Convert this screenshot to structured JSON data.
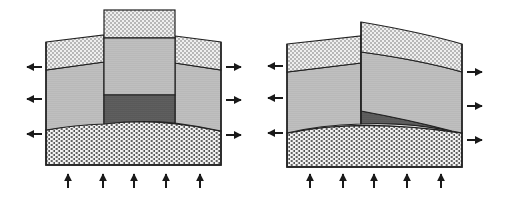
{
  "figure": {
    "panels": [
      {
        "id": "left",
        "label": "Horst-style uplifted central block",
        "layers": [
          "upper dotted layer",
          "middle fine-stipple layer",
          "dark basal sediment wedge",
          "lower coarse-pattern basement"
        ],
        "arrows_left": 3,
        "arrows_right": 3,
        "arrows_up": 5
      },
      {
        "id": "right",
        "label": "Tilted fault block",
        "layers": [
          "upper dotted layer",
          "middle fine-stipple layer",
          "dark basal sediment wedge",
          "lower coarse-pattern basement"
        ],
        "arrows_left": 3,
        "arrows_right": 3,
        "arrows_up": 5
      }
    ],
    "colors": {
      "outline": "#222222",
      "upper_layer": "#dcdcdc",
      "middle_layer": "#bdbdbd",
      "dark_wedge": "#5a5a5a",
      "basement": "#a8a8a8",
      "arrow": "#1a1a1a"
    }
  }
}
